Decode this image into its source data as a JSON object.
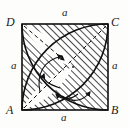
{
  "figure": {
    "kind": "geometry-diagram",
    "background_color": "#fdfdfc",
    "stroke_color": "#111111",
    "hatch_color": "#2b2b2b",
    "square": {
      "side_label": "a",
      "left": 22,
      "top": 24,
      "size": 86,
      "vertices": [
        {
          "name": "A",
          "label": "A",
          "position": "bottom-left",
          "x": 22,
          "y": 110
        },
        {
          "name": "B",
          "label": "B",
          "position": "bottom-right",
          "x": 108,
          "y": 110
        },
        {
          "name": "C",
          "label": "C",
          "position": "top-right",
          "x": 108,
          "y": 24
        },
        {
          "name": "D",
          "label": "D",
          "position": "top-left",
          "x": 22,
          "y": 24
        }
      ]
    },
    "side_labels": [
      {
        "name": "top",
        "label": "a",
        "edge": "DC"
      },
      {
        "name": "right",
        "label": "a",
        "edge": "CB"
      },
      {
        "name": "bottom",
        "label": "a",
        "edge": "AB"
      },
      {
        "name": "left",
        "label": "a",
        "edge": "DA"
      }
    ],
    "arcs": [
      {
        "name": "arc-centered-at-A",
        "center": "A",
        "radius_label": "a"
      },
      {
        "name": "arc-centered-at-D",
        "center": "D",
        "radius_label": "a"
      },
      {
        "name": "arc-centered-at-B",
        "center": "B",
        "radius_label": "a"
      }
    ],
    "dashed_lines": [
      {
        "name": "diagonal-A-to-C",
        "from": "A",
        "to": "C"
      },
      {
        "name": "radius-D-to-center",
        "from": "D",
        "to": "center"
      }
    ],
    "arrow_markers": [
      {
        "name": "arrow-upper-left",
        "points_to": "arc-centered-at-D"
      },
      {
        "name": "arrow-left",
        "points_to": "arc-centered-at-A"
      },
      {
        "name": "arrow-lower-left",
        "points_to": "arc-centered-at-A"
      },
      {
        "name": "arrow-lower-right",
        "points_to": "arc-centered-at-B"
      }
    ],
    "center_point": {
      "name": "center",
      "x": 73,
      "y": 67
    }
  }
}
